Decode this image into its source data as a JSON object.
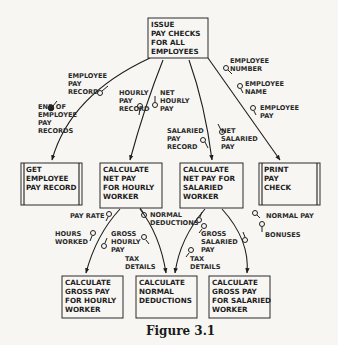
{
  "figure": {
    "caption": "Figure 3.1"
  },
  "modules": {
    "top": {
      "lines": [
        "ISSUE",
        "PAY CHECKS",
        "FOR ALL",
        "EMPLOYEES"
      ]
    },
    "get_record": {
      "lines": [
        "GET",
        "EMPLOYEE",
        "PAY RECORD"
      ],
      "library": true
    },
    "net_hourly": {
      "lines": [
        "CALCULATE",
        "NET PAY",
        "FOR HOURLY",
        "WORKER"
      ]
    },
    "net_salaried": {
      "lines": [
        "CALCULATE",
        "NET PAY FOR",
        "SALARIED",
        "WORKER"
      ]
    },
    "print_check": {
      "lines": [
        "PRINT",
        "PAY",
        "CHECK"
      ],
      "library": true
    },
    "gross_hourly": {
      "lines": [
        "CALCULATE",
        "GROSS PAY",
        "FOR HOURLY",
        "WORKER"
      ]
    },
    "normal_deductions": {
      "lines": [
        "CALCULATE",
        "NORMAL",
        "DEDUCTIONS"
      ]
    },
    "gross_salaried": {
      "lines": [
        "CALCULATE",
        "GROSS PAY",
        "FOR SALARIED",
        "WORKER"
      ]
    }
  },
  "couples": {
    "employee_pay_record": [
      "EMPLOYEE",
      "PAY",
      "RECORD"
    ],
    "end_of_records": [
      "END OF",
      "EMPLOYEE",
      "PAY",
      "RECORDS"
    ],
    "hourly_pay_record": [
      "HOURLY",
      "PAY",
      "RECORD"
    ],
    "net_hourly_pay": [
      "NET",
      "HOURLY",
      "PAY"
    ],
    "salaried_pay_record": [
      "SALARIED",
      "PAY",
      "RECORD"
    ],
    "net_salaried_pay": [
      "NET",
      "SALARIED",
      "PAY"
    ],
    "employee_number": [
      "EMPLOYEE",
      "NUMBER"
    ],
    "employee_name": [
      "EMPLOYEE",
      "NAME"
    ],
    "employee_pay": [
      "EMPLOYEE",
      "PAY"
    ],
    "pay_rate": [
      "PAY RATE"
    ],
    "normal_deductions_1": [
      "NORMAL",
      "DEDUCTIONS"
    ],
    "hours_worked": [
      "HOURS",
      "WORKED"
    ],
    "gross_hourly_pay": [
      "GROSS",
      "HOURLY",
      "PAY"
    ],
    "tax_details_1": [
      "TAX",
      "DETAILS"
    ],
    "gross_salaried_pay": [
      "GROSS",
      "SALARIED",
      "PAY"
    ],
    "tax_details_2": [
      "TAX",
      "DETAILS"
    ],
    "normal_pay": [
      "NORMAL PAY"
    ],
    "bonuses": [
      "BONUSES"
    ]
  }
}
